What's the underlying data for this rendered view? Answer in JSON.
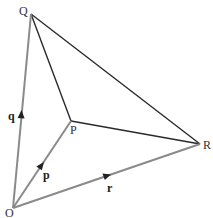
{
  "diagram": {
    "points": {
      "O": {
        "label": "O"
      },
      "P": {
        "label": "P"
      },
      "Q": {
        "label": "Q"
      },
      "R": {
        "label": "R"
      }
    },
    "vectors": [
      {
        "from": "O",
        "to": "P",
        "label": "p"
      },
      {
        "from": "O",
        "to": "Q",
        "label": "q"
      },
      {
        "from": "O",
        "to": "R",
        "label": "r"
      }
    ],
    "segments": [
      {
        "from": "Q",
        "to": "R"
      },
      {
        "from": "Q",
        "to": "P"
      },
      {
        "from": "P",
        "to": "R"
      }
    ],
    "colors": {
      "vector_lines": "#8a8a8a",
      "triangle_lines": "#2a2a2a"
    }
  }
}
